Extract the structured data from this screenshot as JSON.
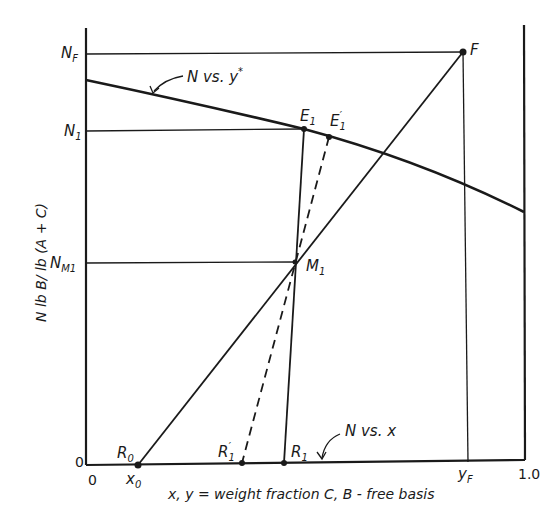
{
  "diagram": {
    "type": "Ponchon-Savarit style extraction diagram (single stage)",
    "axes": {
      "x_label": "x, y = weight fraction C, B - free basis",
      "y_label": "N lb B/ lb (A + C)",
      "x_origin_label": "0",
      "y_origin_label": "0",
      "x_end_label": "1.0",
      "x_ticks": {
        "x0": {
          "main": "x",
          "sub": "0"
        },
        "yF": {
          "main": "y",
          "sub": "F"
        }
      },
      "y_ticks": {
        "NF": {
          "main": "N",
          "sub": "F"
        },
        "N1": {
          "main": "N",
          "sub": "1"
        },
        "NM1": {
          "main": "N",
          "sub": "M1"
        }
      }
    },
    "curves": {
      "extract": {
        "label_main": "N vs. y",
        "label_sup": "*"
      },
      "raffinate": {
        "label": "N vs. x"
      }
    },
    "points": {
      "F": {
        "label": "F"
      },
      "E1": {
        "main": "E",
        "sub": "1"
      },
      "E1p": {
        "main": "E",
        "sub": "1",
        "prime": "′"
      },
      "M1": {
        "main": "M",
        "sub": "1"
      },
      "R0": {
        "main": "R",
        "sub": "0"
      },
      "R1": {
        "main": "R",
        "sub": "1"
      },
      "R1p": {
        "main": "R",
        "sub": "1",
        "prime": "′"
      }
    }
  }
}
